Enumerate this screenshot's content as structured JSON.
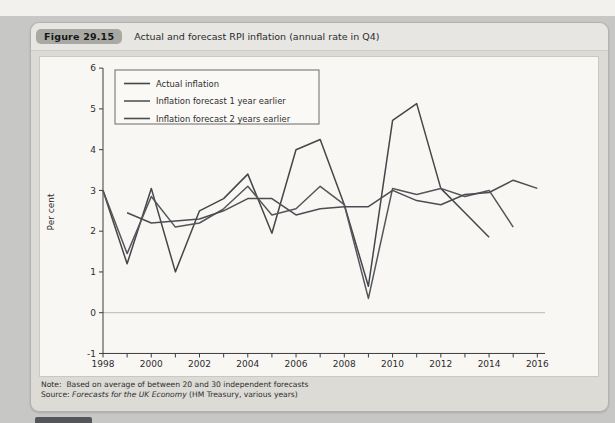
{
  "figure": {
    "badge": "Figure 29.15",
    "title": "Actual and forecast RPI inflation (annual rate in Q4)"
  },
  "note": {
    "label": "Note:",
    "text": "Based on average of between 20 and 30 independent forecasts"
  },
  "source": {
    "label": "Source:",
    "italic_part": "Forecasts for the UK Economy",
    "rest": " (HM Treasury, various years)"
  },
  "chart_data": {
    "type": "line",
    "title": "Actual and forecast RPI inflation (annual rate in Q4)",
    "xlabel": "",
    "ylabel": "Per cent",
    "xlim": [
      1998,
      2016
    ],
    "ylim": [
      -1,
      6
    ],
    "yticks": [
      -1,
      0,
      1,
      2,
      3,
      4,
      5,
      6
    ],
    "xticks_minor_every_year": true,
    "xtick_labels": [
      1998,
      2000,
      2002,
      2004,
      2006,
      2008,
      2010,
      2012,
      2014,
      2016
    ],
    "zero_line": true,
    "grid": false,
    "legend_position": "upper-left",
    "axis_color": "#3d3d3d",
    "zero_line_color": "#a9a8a4",
    "series": [
      {
        "name": "Actual inflation",
        "color": "#44464a",
        "x": [
          1998,
          1999,
          2000,
          2001,
          2002,
          2003,
          2004,
          2005,
          2006,
          2007,
          2008,
          2009,
          2010,
          2011,
          2012,
          2013,
          2014
        ],
        "values": [
          3.0,
          1.2,
          3.05,
          1.0,
          2.5,
          2.8,
          3.4,
          1.95,
          4.0,
          4.25,
          2.65,
          0.65,
          4.72,
          5.13,
          3.05,
          2.45,
          1.85
        ]
      },
      {
        "name": "Inflation forecast 1 year earlier",
        "color": "#54565a",
        "x": [
          1998,
          1999,
          2000,
          2001,
          2002,
          2003,
          2004,
          2005,
          2006,
          2007,
          2008,
          2009,
          2010,
          2011,
          2012,
          2013,
          2014,
          2015
        ],
        "values": [
          3.0,
          1.45,
          2.85,
          2.1,
          2.2,
          2.55,
          3.1,
          2.4,
          2.55,
          3.1,
          2.65,
          0.35,
          3.05,
          2.9,
          3.05,
          2.85,
          3.0,
          2.1
        ]
      },
      {
        "name": "Inflation forecast 2 years earlier",
        "color": "#4b4d52",
        "x": [
          1999,
          2000,
          2001,
          2002,
          2003,
          2004,
          2005,
          2006,
          2007,
          2008,
          2009,
          2010,
          2011,
          2012,
          2013,
          2014,
          2015,
          2016
        ],
        "values": [
          2.45,
          2.2,
          2.25,
          2.3,
          2.5,
          2.8,
          2.8,
          2.4,
          2.55,
          2.6,
          2.6,
          3.0,
          2.75,
          2.65,
          2.9,
          2.95,
          3.25,
          3.05
        ]
      }
    ]
  }
}
